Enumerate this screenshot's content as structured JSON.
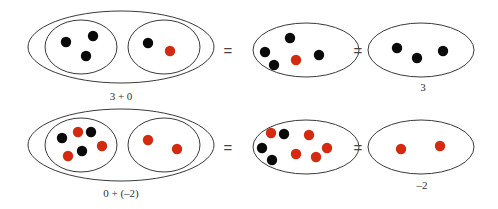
{
  "colors": {
    "background": "#ffffff",
    "outline": "#3a3a3a",
    "black_chip": "#0a0a0a",
    "red_chip": "#d42a10",
    "text": "#333333"
  },
  "equals_sign": "=",
  "rows": [
    {
      "id": "row-1",
      "expression_label": "3 + 0",
      "result_label": "3",
      "outer_ellipse": {
        "cx": 121,
        "cy": 47,
        "rx": 93,
        "ry": 36
      },
      "inner_ellipses": [
        {
          "cx": 81,
          "cy": 47,
          "rx": 36,
          "ry": 27,
          "chips": [
            {
              "x": 66,
              "y": 42,
              "color": "black"
            },
            {
              "x": 93,
              "y": 36,
              "color": "black"
            },
            {
              "x": 86,
              "y": 56,
              "color": "black"
            }
          ]
        },
        {
          "cx": 164,
          "cy": 47,
          "rx": 36,
          "ry": 27,
          "chips": [
            {
              "x": 148,
              "y": 43,
              "color": "black"
            },
            {
              "x": 170,
              "y": 51,
              "color": "red"
            }
          ]
        }
      ],
      "equals_1": {
        "x": 228,
        "y": 56
      },
      "combined_ellipse": {
        "cx": 306,
        "cy": 50,
        "rx": 53,
        "ry": 27,
        "chips": [
          {
            "x": 290,
            "y": 38,
            "color": "black"
          },
          {
            "x": 265,
            "y": 52,
            "color": "black"
          },
          {
            "x": 274,
            "y": 65,
            "color": "black"
          },
          {
            "x": 296,
            "y": 60,
            "color": "red"
          },
          {
            "x": 319,
            "y": 55,
            "color": "black"
          }
        ]
      },
      "equals_2": {
        "x": 358,
        "y": 56
      },
      "result_ellipse": {
        "cx": 421,
        "cy": 50,
        "rx": 53,
        "ry": 27,
        "chips": [
          {
            "x": 397,
            "y": 48,
            "color": "black"
          },
          {
            "x": 417,
            "y": 58,
            "color": "black"
          },
          {
            "x": 443,
            "y": 51,
            "color": "black"
          }
        ]
      },
      "expression_label_pos": {
        "x": 121,
        "y": 100
      },
      "result_label_pos": {
        "x": 423,
        "y": 91
      }
    },
    {
      "id": "row-2",
      "expression_label": "0 + (–2)",
      "result_label": "–2",
      "outer_ellipse": {
        "cx": 121,
        "cy": 145,
        "rx": 93,
        "ry": 36
      },
      "inner_ellipses": [
        {
          "cx": 81,
          "cy": 145,
          "rx": 36,
          "ry": 27,
          "chips": [
            {
              "x": 62,
              "y": 138,
              "color": "black"
            },
            {
              "x": 78,
              "y": 132,
              "color": "red"
            },
            {
              "x": 91,
              "y": 132,
              "color": "black"
            },
            {
              "x": 68,
              "y": 156,
              "color": "red"
            },
            {
              "x": 82,
              "y": 151,
              "color": "black"
            },
            {
              "x": 102,
              "y": 146,
              "color": "red"
            }
          ]
        },
        {
          "cx": 164,
          "cy": 145,
          "rx": 36,
          "ry": 27,
          "chips": [
            {
              "x": 148,
              "y": 140,
              "color": "red"
            },
            {
              "x": 177,
              "y": 149,
              "color": "red"
            }
          ]
        }
      ],
      "equals_1": {
        "x": 228,
        "y": 153
      },
      "combined_ellipse": {
        "cx": 306,
        "cy": 147,
        "rx": 53,
        "ry": 27,
        "chips": [
          {
            "x": 271,
            "y": 133,
            "color": "red"
          },
          {
            "x": 284,
            "y": 134,
            "color": "black"
          },
          {
            "x": 262,
            "y": 148,
            "color": "black"
          },
          {
            "x": 272,
            "y": 160,
            "color": "black"
          },
          {
            "x": 309,
            "y": 135,
            "color": "red"
          },
          {
            "x": 296,
            "y": 154,
            "color": "red"
          },
          {
            "x": 316,
            "y": 157,
            "color": "red"
          },
          {
            "x": 327,
            "y": 148,
            "color": "red"
          }
        ]
      },
      "equals_2": {
        "x": 358,
        "y": 153
      },
      "result_ellipse": {
        "cx": 421,
        "cy": 147,
        "rx": 53,
        "ry": 27,
        "chips": [
          {
            "x": 401,
            "y": 149,
            "color": "red"
          },
          {
            "x": 440,
            "y": 146,
            "color": "red"
          }
        ]
      },
      "expression_label_pos": {
        "x": 121,
        "y": 197
      },
      "result_label_pos": {
        "x": 422,
        "y": 189
      }
    }
  ]
}
